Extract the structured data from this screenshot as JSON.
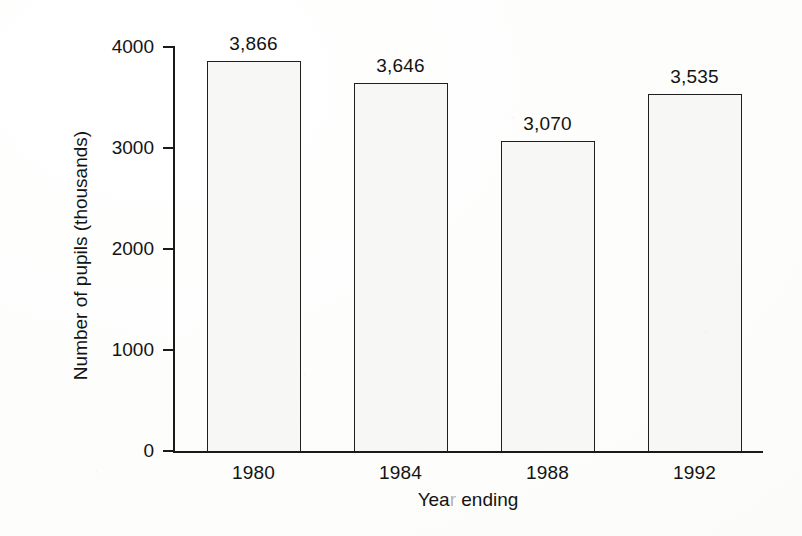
{
  "chart_data": {
    "type": "bar",
    "title": "",
    "subtitle": "",
    "xlabel": "Year ending",
    "ylabel": "Number of pupils (thousands)",
    "categories": [
      "1980",
      "1984",
      "1988",
      "1992"
    ],
    "values": [
      3866,
      3646,
      3070,
      3535
    ],
    "value_labels": [
      "3,866",
      "3,646",
      "3,070",
      "3,535"
    ],
    "series": [
      {
        "name": "Number of pupils",
        "values": [
          3866,
          3646,
          3070,
          3535
        ]
      }
    ],
    "ylim": [
      0,
      4000
    ],
    "xlim": null,
    "y_ticks": [
      0,
      1000,
      2000,
      3000,
      4000
    ],
    "y_tick_labels": [
      "0",
      "1000",
      "2000",
      "3000",
      "4000"
    ],
    "x_tick_labels": [
      "1980",
      "1984",
      "1988",
      "1992"
    ],
    "grid": false,
    "legend": false,
    "legend_position": "none",
    "annotations": [],
    "colors": {
      "bar_fill": "#f7f7f5",
      "bar_outline": "#1f1f1f",
      "axis": "#1a1a1a",
      "text": "#131313",
      "background": "#ffffff"
    }
  },
  "axis_titles": {
    "x": "Year ending",
    "x_part_1": "Yea",
    "x_faint_letter": "r",
    "x_part_2": " ending",
    "y": "Number of pupils (thousands)"
  }
}
